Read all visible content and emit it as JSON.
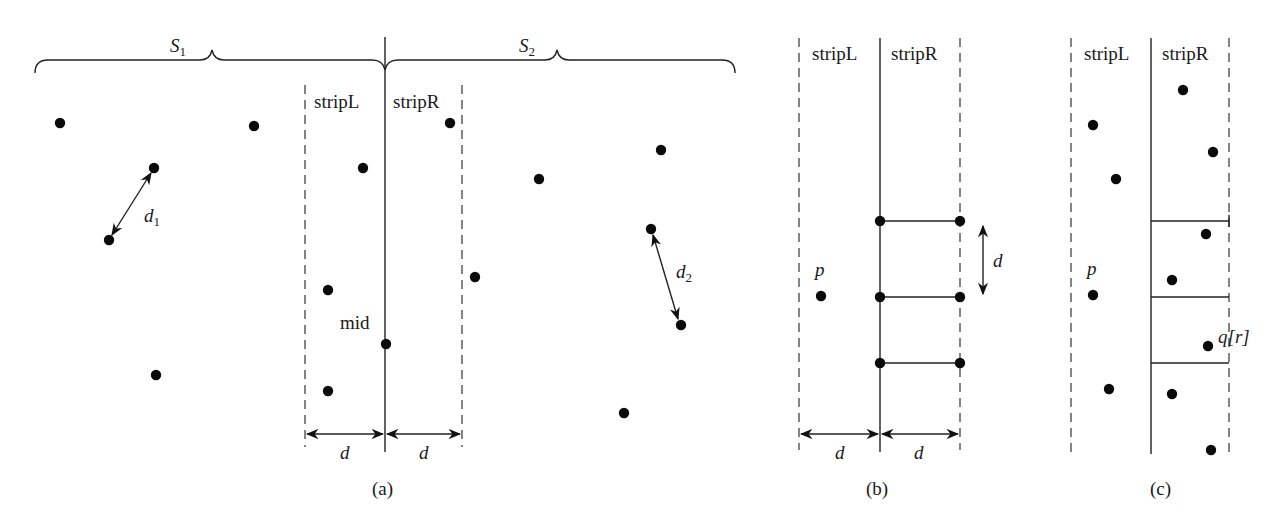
{
  "figure": {
    "panels": [
      {
        "id": "a",
        "caption": "(a)",
        "brace_labels": [
          {
            "text": "S",
            "sub": "1",
            "x": 170,
            "y": 52
          },
          {
            "text": "S",
            "sub": "2",
            "x": 519,
            "y": 52
          }
        ],
        "strip_labels": {
          "left": "stripL",
          "right": "stripR"
        },
        "mid_label": "mid",
        "distance_labels": [
          {
            "text": "d",
            "sub": "1",
            "x": 172,
            "y": 222
          },
          {
            "text": "d",
            "sub": "2",
            "x": 676,
            "y": 278
          }
        ],
        "width_labels": [
          "d",
          "d"
        ],
        "points": [
          [
            60,
            123
          ],
          [
            254,
            126
          ],
          [
            154,
            168
          ],
          [
            109,
            240
          ],
          [
            156,
            375
          ],
          [
            363,
            168
          ],
          [
            328,
            290
          ],
          [
            328,
            391
          ],
          [
            386,
            344
          ],
          [
            450,
            123
          ],
          [
            475,
            277
          ],
          [
            539,
            179
          ],
          [
            661,
            150
          ],
          [
            651,
            229
          ],
          [
            681,
            325
          ],
          [
            624,
            413
          ]
        ]
      },
      {
        "id": "b",
        "caption": "(b)",
        "strip_labels": {
          "left": "stripL",
          "right": "stripR"
        },
        "point_label": "p",
        "height_label": "d",
        "width_labels": [
          "d",
          "d"
        ],
        "points": [
          [
            821,
            296
          ],
          [
            880,
            221
          ],
          [
            960,
            221
          ],
          [
            880,
            297
          ],
          [
            960,
            297
          ],
          [
            880,
            363
          ],
          [
            960,
            363
          ]
        ]
      },
      {
        "id": "c",
        "caption": "(c)",
        "strip_labels": {
          "left": "stripL",
          "right": "stripR"
        },
        "point_label": "p",
        "target_label": "q[r]",
        "points": [
          [
            1183,
            90
          ],
          [
            1093,
            125
          ],
          [
            1213,
            152
          ],
          [
            1116,
            179
          ],
          [
            1206,
            234
          ],
          [
            1172,
            280
          ],
          [
            1093,
            295
          ],
          [
            1208,
            346
          ],
          [
            1109,
            389
          ],
          [
            1172,
            394
          ],
          [
            1211,
            450
          ]
        ]
      }
    ]
  }
}
